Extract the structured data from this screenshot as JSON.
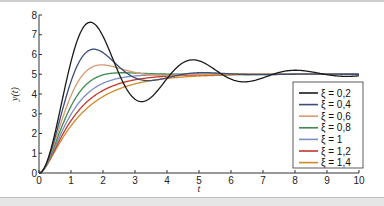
{
  "chart_data": {
    "type": "line",
    "title": "",
    "xlabel": "t",
    "ylabel": "y(t)",
    "xlim": [
      0,
      10
    ],
    "ylim": [
      0,
      8
    ],
    "xticks": [
      0,
      1,
      2,
      3,
      4,
      5,
      6,
      7,
      8,
      9,
      10
    ],
    "yticks": [
      0,
      1,
      2,
      3,
      4,
      5,
      6,
      7,
      8
    ],
    "grid": false,
    "legend_position": "lower right",
    "final_value": 5,
    "natural_frequency": 2,
    "series": [
      {
        "name": "ξ = 0,2",
        "zeta": 0.2,
        "color": "#1a1a1a",
        "peak": {
          "t": 1.6,
          "y": 7.6
        }
      },
      {
        "name": "ξ = 0,4",
        "zeta": 0.4,
        "color": "#3b4f7a",
        "peak": {
          "t": 1.7,
          "y": 6.25
        }
      },
      {
        "name": "ξ = 0,6",
        "zeta": 0.6,
        "color": "#d99a72",
        "peak": {
          "t": 2.0,
          "y": 5.5
        }
      },
      {
        "name": "ξ = 0,8",
        "zeta": 0.8,
        "color": "#3f8a4e",
        "peak": {
          "t": 2.6,
          "y": 5.08
        }
      },
      {
        "name": "ξ = 1",
        "zeta": 1.0,
        "color": "#7c8fc4",
        "peak": null
      },
      {
        "name": "ξ = 1,2",
        "zeta": 1.2,
        "color": "#c0392b",
        "peak": null
      },
      {
        "name": "ξ = 1,4",
        "zeta": 1.4,
        "color": "#d08a2a",
        "peak": null
      }
    ]
  },
  "axes": {
    "x_label": "t",
    "y_label": "y(t)",
    "x_tick_labels": [
      "0",
      "1",
      "2",
      "3",
      "4",
      "5",
      "6",
      "7",
      "8",
      "9",
      "10"
    ],
    "y_tick_labels": [
      "0",
      "1",
      "2",
      "3",
      "4",
      "5",
      "6",
      "7",
      "8"
    ]
  },
  "legend": {
    "items": [
      "ξ = 0,2",
      "ξ = 0,4",
      "ξ = 0,6",
      "ξ = 0,8",
      "ξ = 1",
      "ξ = 1,2",
      "ξ = 1,4"
    ]
  }
}
